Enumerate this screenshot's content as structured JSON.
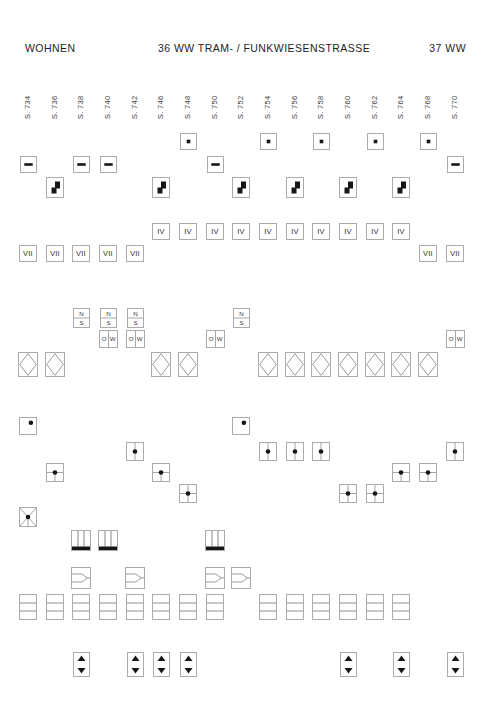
{
  "header": {
    "left": "WOHNEN",
    "center": "36 WW TRAM- / FUNKWIESENSTRASSE",
    "right": "37 WW"
  },
  "colors": {
    "symbol": "#161616",
    "box_border": "#ababab",
    "line": "#8f8f8f",
    "text": "#3a3a3a"
  },
  "columns": [
    {
      "label": "S. 734",
      "x": 28
    },
    {
      "label": "S. 736",
      "x": 55
    },
    {
      "label": "S. 738",
      "x": 81
    },
    {
      "label": "S. 740",
      "x": 108
    },
    {
      "label": "S. 742",
      "x": 135
    },
    {
      "label": "S. 746",
      "x": 161
    },
    {
      "label": "S. 748",
      "x": 188
    },
    {
      "label": "S. 750",
      "x": 215
    },
    {
      "label": "S. 752",
      "x": 241
    },
    {
      "label": "S. 754",
      "x": 268
    },
    {
      "label": "S. 756",
      "x": 295
    },
    {
      "label": "S. 758",
      "x": 321
    },
    {
      "label": "S. 760",
      "x": 348
    },
    {
      "label": "S. 762",
      "x": 375
    },
    {
      "label": "S. 764",
      "x": 401
    },
    {
      "label": "S. 768",
      "x": 428
    },
    {
      "label": "S. 770",
      "x": 455
    }
  ],
  "rows": [
    {
      "name": "square-dot-row",
      "glyph": "square-dot",
      "y": 133,
      "w": 17,
      "h": 17,
      "cols": [
        "S. 748",
        "S. 754",
        "S. 758",
        "S. 762",
        "S. 768"
      ]
    },
    {
      "name": "dash-row",
      "glyph": "minus",
      "y": 156,
      "w": 17,
      "h": 17,
      "cols": [
        "S. 734",
        "S. 738",
        "S. 740",
        "S. 750",
        "S. 770"
      ]
    },
    {
      "name": "stair-row",
      "glyph": "step",
      "y": 177,
      "w": 18,
      "h": 21,
      "cols": [
        "S. 736",
        "S. 746",
        "S. 752",
        "S. 756",
        "S. 760",
        "S. 764"
      ]
    },
    {
      "name": "storeys-iv-row",
      "glyph": "text",
      "text": "IV",
      "y": 223,
      "w": 18,
      "h": 17,
      "cols": [
        "S. 746",
        "S. 748",
        "S. 750",
        "S. 752",
        "S. 754",
        "S. 756",
        "S. 758",
        "S. 760",
        "S. 762",
        "S. 764"
      ]
    },
    {
      "name": "storeys-vii-row",
      "glyph": "text",
      "text": "VII",
      "y": 245,
      "w": 18,
      "h": 17,
      "cols": [
        "S. 734",
        "S. 736",
        "S. 738",
        "S. 740",
        "S. 742",
        "S. 768",
        "S. 770"
      ]
    },
    {
      "name": "orientation-ns-row",
      "glyph": "ns",
      "n_label": "N",
      "s_label": "S",
      "y": 308,
      "w": 17,
      "h": 20,
      "cols": [
        "S. 738",
        "S. 740",
        "S. 742",
        "S. 752"
      ]
    },
    {
      "name": "orientation-ow-row",
      "glyph": "ow",
      "o_label": "O",
      "w_label": "W",
      "y": 330,
      "w": 19,
      "h": 18,
      "cols": [
        "S. 740",
        "S. 742",
        "S. 750",
        "S. 770"
      ]
    },
    {
      "name": "diamond-row",
      "glyph": "diamond",
      "y": 352,
      "w": 20,
      "h": 25,
      "cols": [
        "S. 734",
        "S. 736",
        "S. 746",
        "S. 748",
        "S. 754",
        "S. 756",
        "S. 758",
        "S. 760",
        "S. 762",
        "S. 764",
        "S. 768"
      ]
    },
    {
      "name": "corner-dot-row",
      "glyph": "dot-tr",
      "y": 417,
      "w": 18,
      "h": 18,
      "cols": [
        "S. 734",
        "S. 752"
      ]
    },
    {
      "name": "axis-dot-row",
      "glyph": "dot-vline",
      "y": 442,
      "w": 18,
      "h": 19,
      "cols": [
        "S. 742",
        "S. 754",
        "S. 756",
        "S. 758",
        "S. 770"
      ]
    },
    {
      "name": "tee-dot-row",
      "glyph": "dot-tee",
      "y": 463,
      "w": 18,
      "h": 19,
      "cols": [
        "S. 736",
        "S. 746",
        "S. 764",
        "S. 768"
      ]
    },
    {
      "name": "cross-dot-row",
      "glyph": "dot-cross",
      "y": 484,
      "w": 18,
      "h": 19,
      "cols": [
        "S. 748",
        "S. 760",
        "S. 762"
      ]
    },
    {
      "name": "star-dot-row",
      "glyph": "dot-star",
      "y": 507,
      "w": 18,
      "h": 20,
      "cols": [
        "S. 734"
      ]
    },
    {
      "name": "shaft-row",
      "glyph": "hatch",
      "y": 530,
      "w": 20,
      "h": 21,
      "cols": [
        "S. 738",
        "S. 740",
        "S. 750"
      ]
    },
    {
      "name": "junction-row",
      "glyph": "branch",
      "y": 567,
      "w": 20,
      "h": 22,
      "cols": [
        "S. 738",
        "S. 742",
        "S. 750",
        "S. 752"
      ]
    },
    {
      "name": "bands-row",
      "glyph": "bands",
      "y": 594,
      "w": 18,
      "h": 26,
      "cols": [
        "S. 734",
        "S. 736",
        "S. 738",
        "S. 740",
        "S. 742",
        "S. 746",
        "S. 748",
        "S. 750",
        "S. 754",
        "S. 756",
        "S. 758",
        "S. 760",
        "S. 762",
        "S. 764"
      ]
    },
    {
      "name": "lift-arrows-row",
      "glyph": "arrows",
      "y": 652,
      "w": 17,
      "h": 25,
      "cols": [
        "S. 738",
        "S. 742",
        "S. 746",
        "S. 748",
        "S. 760",
        "S. 764",
        "S. 770"
      ]
    }
  ]
}
